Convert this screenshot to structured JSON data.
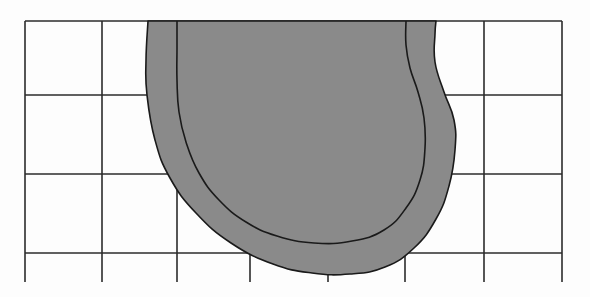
{
  "figure": {
    "width": 590,
    "height": 297,
    "background_color": "#fdfdfd"
  },
  "chart_data": {
    "type": "line",
    "subtitle": "",
    "xlabel": "",
    "ylabel": "",
    "xlim": [
      25,
      562
    ],
    "ylim": [
      21,
      282
    ],
    "grid": true,
    "legend_position": "none",
    "tick_labels_x": [],
    "tick_labels_y": [],
    "annotations": [],
    "grid_spec": {
      "line_color": "#2b2b2b",
      "line_width": 1.6,
      "vertical_lines_x": [
        25,
        102,
        177,
        250,
        328,
        405,
        484,
        562
      ],
      "vertical_line_top_y": 21,
      "vertical_line_bottom_y": 282,
      "horizontal_lines_y": [
        21,
        95,
        174,
        253
      ],
      "horizontal_line_left_x": 25,
      "horizontal_line_right_x": 562,
      "columns": 7,
      "rows": 3,
      "cell_width": 76.7,
      "cell_height": 77.3
    },
    "band": {
      "name": "u-shaped-band",
      "fill_color": "#8a8a8a",
      "stroke_color": "#1a1a1a",
      "stroke_width": 1.6,
      "thickness": 30,
      "outer_edge_points": [
        [
          148,
          21
        ],
        [
          146,
          60
        ],
        [
          147,
          95
        ],
        [
          155,
          140
        ],
        [
          170,
          178
        ],
        [
          196,
          213
        ],
        [
          231,
          243
        ],
        [
          273,
          264
        ],
        [
          312,
          273
        ],
        [
          350,
          274
        ],
        [
          385,
          267
        ],
        [
          414,
          248
        ],
        [
          436,
          219
        ],
        [
          449,
          186
        ],
        [
          455,
          150
        ],
        [
          454,
          120
        ],
        [
          444,
          92
        ],
        [
          435,
          62
        ],
        [
          435,
          34
        ],
        [
          436,
          21
        ]
      ],
      "inner_edge_points": [
        [
          406,
          21
        ],
        [
          406,
          45
        ],
        [
          410,
          68
        ],
        [
          418,
          92
        ],
        [
          424,
          118
        ],
        [
          425,
          148
        ],
        [
          420,
          180
        ],
        [
          406,
          208
        ],
        [
          384,
          230
        ],
        [
          352,
          241
        ],
        [
          314,
          243
        ],
        [
          277,
          236
        ],
        [
          246,
          222
        ],
        [
          219,
          200
        ],
        [
          199,
          173
        ],
        [
          186,
          142
        ],
        [
          179,
          112
        ],
        [
          177,
          80
        ],
        [
          177,
          48
        ],
        [
          177,
          21
        ]
      ]
    }
  }
}
